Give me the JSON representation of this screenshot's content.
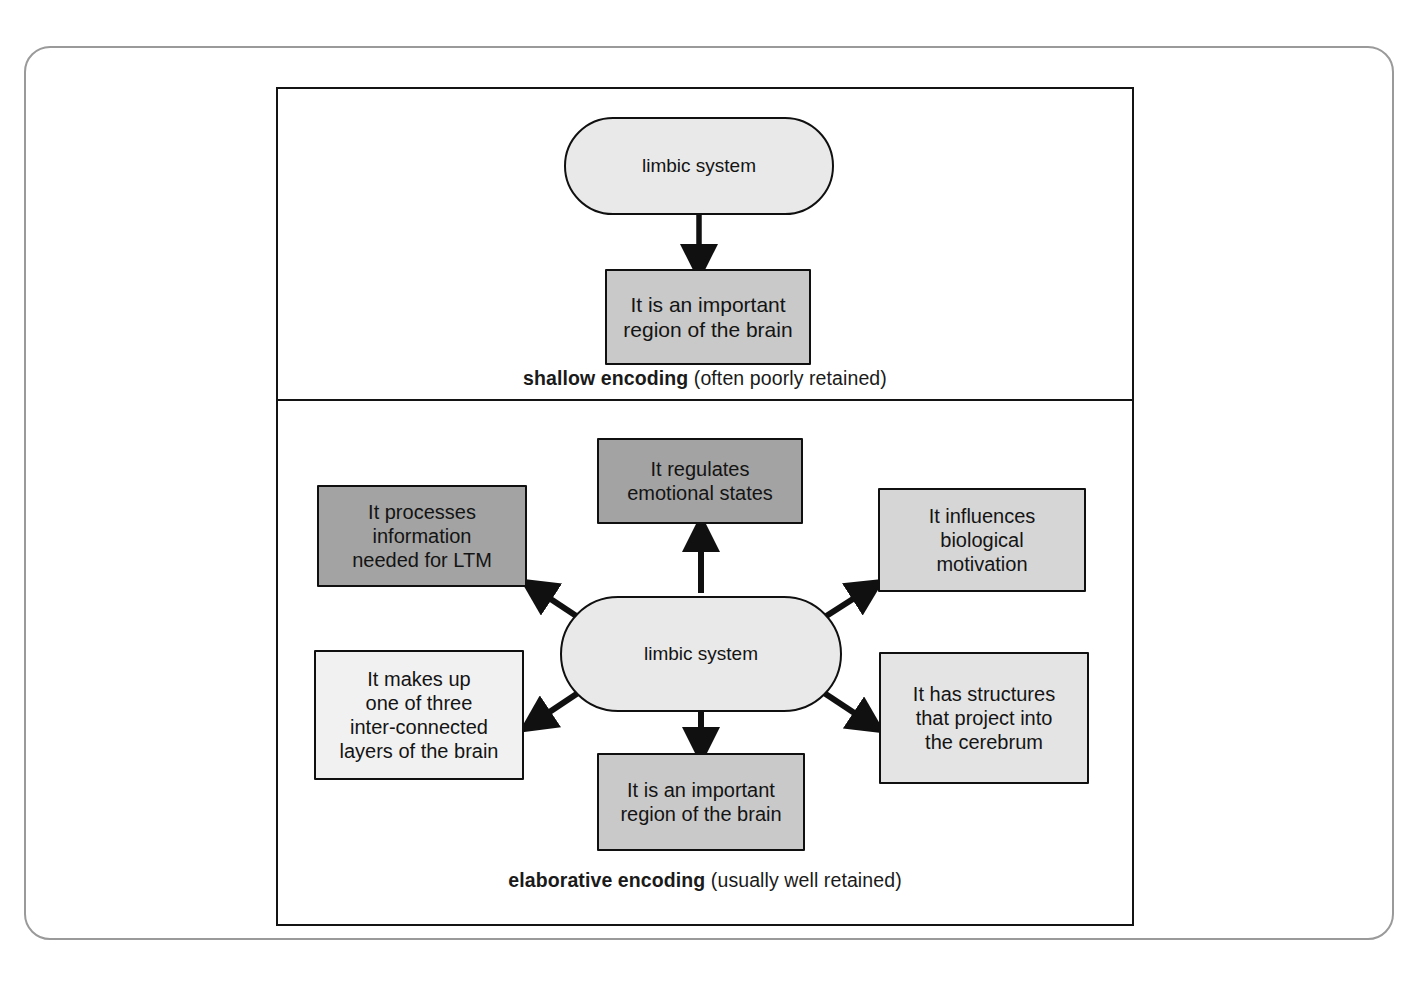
{
  "figure": {
    "frame_border_color": "#9a9a9a",
    "panel_border_color": "#141414"
  },
  "palette": {
    "dark_gray": "#a3a3a3",
    "mid_gray": "#c9c9c9",
    "mid_light_gray": "#d6d6d6",
    "light_gray": "#e4e4e4",
    "very_light_gray": "#f1f1f1",
    "oval_gray": "#e9e9e9",
    "ink": "#141414"
  },
  "shallow": {
    "caption_strong": "shallow encoding",
    "caption_normal": " (often poorly retained)",
    "central": {
      "label": "limbic system",
      "shape": "oval",
      "fill": "#e9e9e9"
    },
    "nodes": [
      {
        "id": "important",
        "label": "It is an important\nregion of the brain",
        "shape": "box",
        "fill": "#c9c9c9"
      }
    ],
    "arrows": [
      {
        "from": "limbic system",
        "to": "It is an important region of the brain",
        "direction": "down"
      }
    ]
  },
  "elaborative": {
    "caption_strong": "elaborative encoding",
    "caption_normal": " (usually well retained)",
    "central": {
      "label": "limbic system",
      "shape": "oval",
      "fill": "#e9e9e9"
    },
    "nodes": [
      {
        "id": "emotional",
        "label": "It regulates\nemotional states",
        "shape": "box",
        "fill": "#a3a3a3",
        "position": "top-center"
      },
      {
        "id": "ltm",
        "label": "It processes\ninformation\nneeded for LTM",
        "shape": "box",
        "fill": "#a3a3a3",
        "position": "top-left"
      },
      {
        "id": "biological",
        "label": "It influences\nbiological\nmotivation",
        "shape": "box",
        "fill": "#d6d6d6",
        "position": "top-right"
      },
      {
        "id": "layers",
        "label": "It makes up\none of three\ninter-connected\nlayers of the brain",
        "shape": "box",
        "fill": "#f1f1f1",
        "position": "bottom-left"
      },
      {
        "id": "cerebrum",
        "label": "It has structures\nthat project into\nthe cerebrum",
        "shape": "box",
        "fill": "#e4e4e4",
        "position": "bottom-right"
      },
      {
        "id": "important",
        "label": "It is an important\nregion of the brain",
        "shape": "box",
        "fill": "#c9c9c9",
        "position": "bottom-center"
      }
    ],
    "arrows": [
      {
        "from": "limbic system",
        "to": "It regulates emotional states",
        "direction": "up"
      },
      {
        "from": "limbic system",
        "to": "It processes information needed for LTM",
        "direction": "up-left"
      },
      {
        "from": "limbic system",
        "to": "It influences biological motivation",
        "direction": "up-right"
      },
      {
        "from": "limbic system",
        "to": "It makes up one of three inter-connected layers of the brain",
        "direction": "down-left"
      },
      {
        "from": "limbic system",
        "to": "It has structures that project into the cerebrum",
        "direction": "down-right"
      },
      {
        "from": "limbic system",
        "to": "It is an important region of the brain",
        "direction": "down"
      }
    ]
  }
}
